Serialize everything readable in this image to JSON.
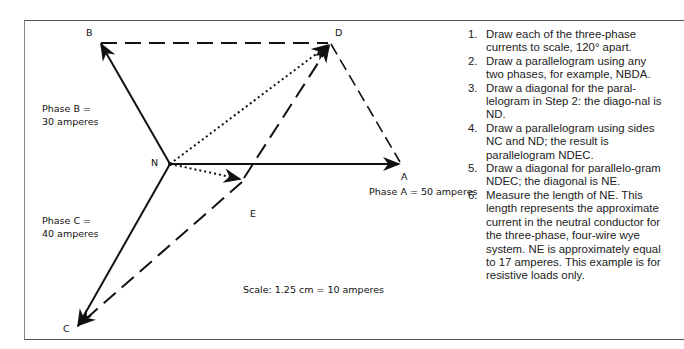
{
  "figure": {
    "points": {
      "B": {
        "label": "B",
        "x": 100,
        "y": 43
      },
      "D": {
        "label": "D",
        "x": 330,
        "y": 43
      },
      "N": {
        "label": "N",
        "x": 170,
        "y": 164
      },
      "A": {
        "label": "A",
        "x": 400,
        "y": 164
      },
      "E": {
        "label": "E",
        "x": 242,
        "y": 180
      },
      "C": {
        "label": "C",
        "x": 77,
        "y": 327
      }
    },
    "labels": {
      "phase_b_line1": "Phase B =",
      "phase_b_line2": "30 amperes",
      "phase_c_line1": "Phase C =",
      "phase_c_line2": "40 amperes",
      "phase_a": "Phase A = 50 amperes",
      "scale": "Scale: 1.25 cm = 10 amperes"
    },
    "vectors": [
      {
        "from": "N",
        "to": "A",
        "style": "solid",
        "arrow": true,
        "name": "phase-a-vector"
      },
      {
        "from": "N",
        "to": "B",
        "style": "solid",
        "arrow": true,
        "name": "phase-b-vector"
      },
      {
        "from": "N",
        "to": "C",
        "style": "solid",
        "arrow": true,
        "name": "phase-c-vector"
      },
      {
        "from": "B",
        "to": "D",
        "style": "dashed",
        "arrow": false,
        "name": "parallelogram-side-bd"
      },
      {
        "from": "D",
        "to": "A",
        "style": "dashed",
        "arrow": false,
        "name": "parallelogram-side-da"
      },
      {
        "from": "N",
        "to": "D",
        "style": "dotted",
        "arrow": true,
        "name": "diagonal-nd"
      },
      {
        "from": "E",
        "to": "D",
        "style": "dashed",
        "arrow": true,
        "name": "parallelogram-side-ed"
      },
      {
        "from": "E",
        "to": "C",
        "style": "dashed",
        "arrow": true,
        "name": "parallelogram-side-ec"
      },
      {
        "from": "N",
        "to": "E",
        "style": "dotted",
        "arrow": true,
        "name": "diagonal-ne"
      }
    ]
  },
  "steps": [
    {
      "num": "1.",
      "text": "Draw each of the three-phase currents to scale, 120° apart."
    },
    {
      "num": "2.",
      "text": "Draw a parallelogram using any two phases, for example, NBDA."
    },
    {
      "num": "3.",
      "text": "Draw a diagonal for the paral-lelogram in Step 2: the diago-nal is ND."
    },
    {
      "num": "4.",
      "text": "Draw a parallelogram using sides NC and ND; the result is parallelogram NDEC."
    },
    {
      "num": "5.",
      "text": "Draw a diagonal for parallelo-gram NDEC; the diagonal is NE."
    },
    {
      "num": "6.",
      "text": "Measure the length of NE. This length represents the approximate current in the neutral conductor for the three-phase, four-wire wye system. NE is approximately equal to 17 amperes. This example is for resistive loads only."
    }
  ]
}
